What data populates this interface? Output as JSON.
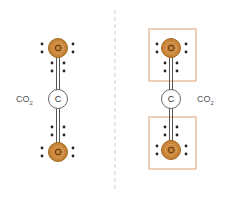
{
  "diagram": {
    "left_panel": {
      "formula_label": "CO",
      "formula_subscript": "2",
      "atoms": [
        {
          "symbol": "O",
          "role": "top-oxygen"
        },
        {
          "symbol": "C",
          "role": "carbon"
        },
        {
          "symbol": "O",
          "role": "bottom-oxygen"
        }
      ]
    },
    "right_panel": {
      "formula_label": "CO",
      "formula_subscript": "2",
      "atoms": [
        {
          "symbol": "O",
          "role": "top-oxygen"
        },
        {
          "symbol": "C",
          "role": "carbon"
        },
        {
          "symbol": "O",
          "role": "bottom-oxygen"
        }
      ],
      "highlight_boxes": 2
    },
    "colors": {
      "oxygen_fill": "#c8853a",
      "oxygen_stroke": "#a06420",
      "carbon_fill": "#ffffff",
      "carbon_stroke": "#666666",
      "box_stroke": "#e0a070",
      "divider": "#cccccc",
      "electron": "#222222"
    }
  }
}
